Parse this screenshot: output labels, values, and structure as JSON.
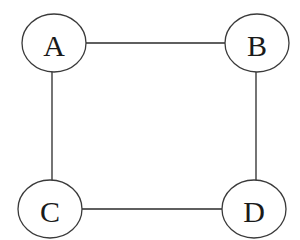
{
  "diagram": {
    "type": "undirected-graph",
    "nodes": [
      {
        "id": "A",
        "label": "A",
        "cx": 54,
        "cy": 43,
        "rx": 32,
        "ry": 29
      },
      {
        "id": "B",
        "label": "B",
        "cx": 257,
        "cy": 43,
        "rx": 32,
        "ry": 29
      },
      {
        "id": "C",
        "label": "C",
        "cx": 50,
        "cy": 209,
        "rx": 32,
        "ry": 29
      },
      {
        "id": "D",
        "label": "D",
        "cx": 254,
        "cy": 209,
        "rx": 32,
        "ry": 29
      }
    ],
    "edges": [
      {
        "from": "A",
        "to": "B"
      },
      {
        "from": "A",
        "to": "C"
      },
      {
        "from": "B",
        "to": "D"
      },
      {
        "from": "C",
        "to": "D"
      }
    ],
    "colors": {
      "background": "#ffffff",
      "stroke": "#2a2a2a",
      "text": "#1a1a1a"
    }
  }
}
